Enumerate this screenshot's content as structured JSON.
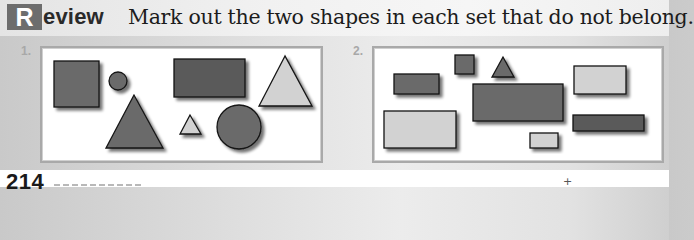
{
  "header": {
    "badge_letter": "R",
    "badge_rest": "eview",
    "instruction": "Mark out the two shapes in each set that do not belong."
  },
  "colors": {
    "dark_fill": "#6b6b6b",
    "darker_fill": "#5a5a5a",
    "light_fill": "#d2d2d2",
    "outline": "#141414",
    "panel_border": "#a9a9a9",
    "badge_bg": "#6d6d6d"
  },
  "sets": [
    {
      "label": "1.",
      "shapes": [
        {
          "type": "square",
          "shade": "dark",
          "x": 54,
          "y": 61,
          "w": 45,
          "h": 46
        },
        {
          "type": "circle",
          "shade": "dark",
          "cx": 118,
          "cy": 81,
          "r": 9
        },
        {
          "type": "triangle",
          "shade": "dark",
          "points": "134,95 106,148 163,148"
        },
        {
          "type": "rectangle",
          "shade": "darker",
          "x": 174,
          "y": 59,
          "w": 71,
          "h": 38
        },
        {
          "type": "triangle",
          "shade": "light",
          "points": "285,56 259,106 312,106"
        },
        {
          "type": "triangle",
          "shade": "light",
          "points": "190,115 180,134 201,134"
        },
        {
          "type": "circle",
          "shade": "dark",
          "cx": 239,
          "cy": 127,
          "r": 22
        }
      ]
    },
    {
      "label": "2.",
      "shapes": [
        {
          "type": "square",
          "shade": "dark",
          "x": 455,
          "y": 55,
          "w": 19,
          "h": 19
        },
        {
          "type": "triangle",
          "shade": "dark",
          "points": "503,57 492,77 514,77"
        },
        {
          "type": "rectangle",
          "shade": "dark",
          "x": 394,
          "y": 74,
          "w": 45,
          "h": 20
        },
        {
          "type": "rectangle",
          "shade": "dark",
          "x": 473,
          "y": 84,
          "w": 90,
          "h": 37
        },
        {
          "type": "rectangle",
          "shade": "light",
          "x": 574,
          "y": 66,
          "w": 52,
          "h": 28
        },
        {
          "type": "rectangle",
          "shade": "light",
          "x": 384,
          "y": 111,
          "w": 72,
          "h": 37
        },
        {
          "type": "rectangle",
          "shade": "darker",
          "x": 573,
          "y": 115,
          "w": 71,
          "h": 16
        },
        {
          "type": "rectangle",
          "shade": "light",
          "x": 530,
          "y": 133,
          "w": 28,
          "h": 15
        }
      ]
    }
  ],
  "footer": {
    "page_number": "214",
    "registration_mark": "+"
  }
}
